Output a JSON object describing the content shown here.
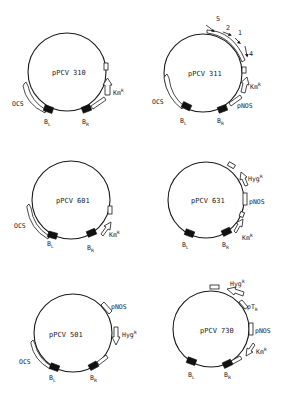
{
  "figure": {
    "type": "plasmid-maps",
    "background": "#ffffff",
    "ink_color": "#1a1a1a"
  },
  "plasmids": [
    {
      "name": "pPCV 310",
      "labels": {
        "ocs": "OCS",
        "bl": "B",
        "bl_sub": "L",
        "br": "B",
        "br_sub": "R",
        "km": "Km",
        "km_sup": "R"
      }
    },
    {
      "name": "pPCV 311",
      "labels": {
        "ocs": "OCS",
        "bl": "B",
        "bl_sub": "L",
        "br": "B",
        "br_sub": "R",
        "km": "Km",
        "km_sup": "R",
        "pnos": "pNOS"
      },
      "transcripts": [
        "5",
        "2",
        "1",
        "4"
      ]
    },
    {
      "name": "pPCV 601",
      "labels": {
        "ocs": "OCS",
        "bl": "B",
        "bl_sub": "L",
        "br": "B",
        "br_sub": "R",
        "km": "Km",
        "km_sup": "R"
      }
    },
    {
      "name": "pPCV 631",
      "labels": {
        "bl": "B",
        "bl_sub": "L",
        "br": "B",
        "br_sub": "R",
        "km": "Km",
        "km_sup": "R",
        "hyg": "Hyg",
        "hyg_sup": "R",
        "pnos": "pNOS"
      }
    },
    {
      "name": "pPCV 501",
      "labels": {
        "ocs": "OCS",
        "bl": "B",
        "bl_sub": "L",
        "br": "B",
        "br_sub": "R",
        "hyg": "Hyg",
        "hyg_sup": "R",
        "pnos": "pNOS"
      }
    },
    {
      "name": "pPCV 730",
      "labels": {
        "bl": "B",
        "bl_sub": "L",
        "br": "B",
        "br_sub": "R",
        "km": "Km",
        "km_sup": "R",
        "hyg": "Hyg",
        "hyg_sup": "R",
        "pnos": "pNOS",
        "ptr": "pT",
        "ptr_sub": "R"
      }
    }
  ]
}
